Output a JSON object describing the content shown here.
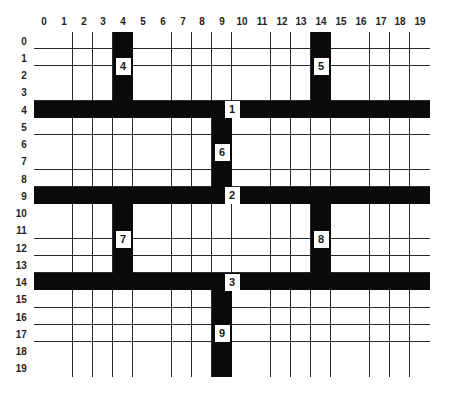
{
  "grid": {
    "columns": 20,
    "rows": 20,
    "column_labels": [
      "0",
      "1",
      "2",
      "3",
      "4",
      "5",
      "6",
      "7",
      "8",
      "9",
      "10",
      "11",
      "12",
      "13",
      "14",
      "15",
      "16",
      "17",
      "18",
      "19"
    ],
    "row_labels": [
      "0",
      "1",
      "2",
      "3",
      "4",
      "5",
      "6",
      "7",
      "8",
      "9",
      "10",
      "11",
      "12",
      "13",
      "14",
      "15",
      "16",
      "17",
      "18",
      "19"
    ],
    "colors": {
      "filled": "#0a0a0a",
      "empty": "#ffffff",
      "gridline": "#2a2a2a",
      "label_text": "#222222"
    },
    "filled_segments": [
      {
        "id": "row-4",
        "orientation": "horizontal",
        "row": 4,
        "col_start": 0,
        "col_end": 19
      },
      {
        "id": "row-9",
        "orientation": "horizontal",
        "row": 9,
        "col_start": 0,
        "col_end": 19
      },
      {
        "id": "row-14",
        "orientation": "horizontal",
        "row": 14,
        "col_start": 0,
        "col_end": 19
      },
      {
        "id": "col-4-top",
        "orientation": "vertical",
        "col": 4,
        "row_start": 0,
        "row_end": 3
      },
      {
        "id": "col-14-top",
        "orientation": "vertical",
        "col": 14,
        "row_start": 0,
        "row_end": 3
      },
      {
        "id": "col-9-mid",
        "orientation": "vertical",
        "col": 9,
        "row_start": 5,
        "row_end": 8
      },
      {
        "id": "col-4-lower",
        "orientation": "vertical",
        "col": 4,
        "row_start": 10,
        "row_end": 13
      },
      {
        "id": "col-14-lower",
        "orientation": "vertical",
        "col": 14,
        "row_start": 10,
        "row_end": 13
      },
      {
        "id": "col-9-bottom",
        "orientation": "vertical",
        "col": 9,
        "row_start": 15,
        "row_end": 19
      }
    ],
    "segment_labels": [
      {
        "text": "1",
        "col": 10,
        "row": 4,
        "col_pos": 10.0,
        "row_pos": 4.5
      },
      {
        "text": "2",
        "col": 10,
        "row": 9,
        "col_pos": 10.0,
        "row_pos": 9.5
      },
      {
        "text": "3",
        "col": 10,
        "row": 14,
        "col_pos": 10.0,
        "row_pos": 14.5
      },
      {
        "text": "4",
        "col": 4,
        "row": 2,
        "col_pos": 4.5,
        "row_pos": 2.0
      },
      {
        "text": "5",
        "col": 14,
        "row": 2,
        "col_pos": 14.5,
        "row_pos": 2.0
      },
      {
        "text": "6",
        "col": 9,
        "row": 7,
        "col_pos": 9.5,
        "row_pos": 7.0
      },
      {
        "text": "7",
        "col": 4,
        "row": 12,
        "col_pos": 4.5,
        "row_pos": 12.0
      },
      {
        "text": "8",
        "col": 14,
        "row": 12,
        "col_pos": 14.5,
        "row_pos": 12.0
      },
      {
        "text": "9",
        "col": 9,
        "row": 17,
        "col_pos": 9.5,
        "row_pos": 17.5
      }
    ]
  }
}
